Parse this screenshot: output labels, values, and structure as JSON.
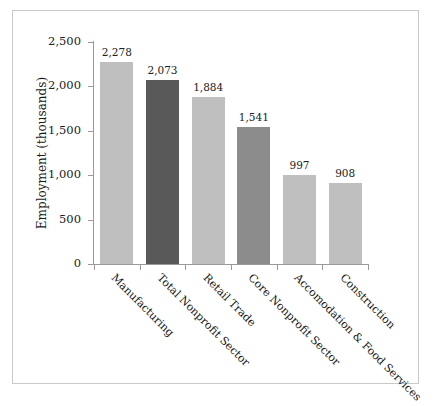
{
  "chart_data": {
    "type": "bar",
    "title": "",
    "subtitle": "",
    "xlabel": "",
    "ylabel": "Employment (thousands)",
    "ylim": [
      0,
      2500
    ],
    "yticks": [
      "0",
      "500",
      "1,000",
      "1,500",
      "2,000",
      "2,500"
    ],
    "ytick_values": [
      0,
      500,
      1000,
      1500,
      2000,
      2500
    ],
    "grid": false,
    "legend": "none",
    "categories": [
      "Manufacturing",
      "Total Nonprofit Sector",
      "Retail Trade",
      "Core Nonprofit Sector",
      "Accomodation & Food Services",
      "Construction"
    ],
    "values": [
      2278,
      2073,
      1884,
      1541,
      997,
      908
    ],
    "value_labels": [
      "2,278",
      "2,073",
      "1,884",
      "1,541",
      "997",
      "908"
    ],
    "bar_colors": [
      "#bfbfbf",
      "#595959",
      "#bfbfbf",
      "#8c8c8c",
      "#bfbfbf",
      "#bfbfbf"
    ]
  },
  "colors": {
    "bar_light": "#bfbfbf",
    "bar_dark": "#595959",
    "bar_medium": "#8c8c8c",
    "axis": "#9a9a9a",
    "frame": "#c9c9c9",
    "text": "#1a1a1a"
  }
}
